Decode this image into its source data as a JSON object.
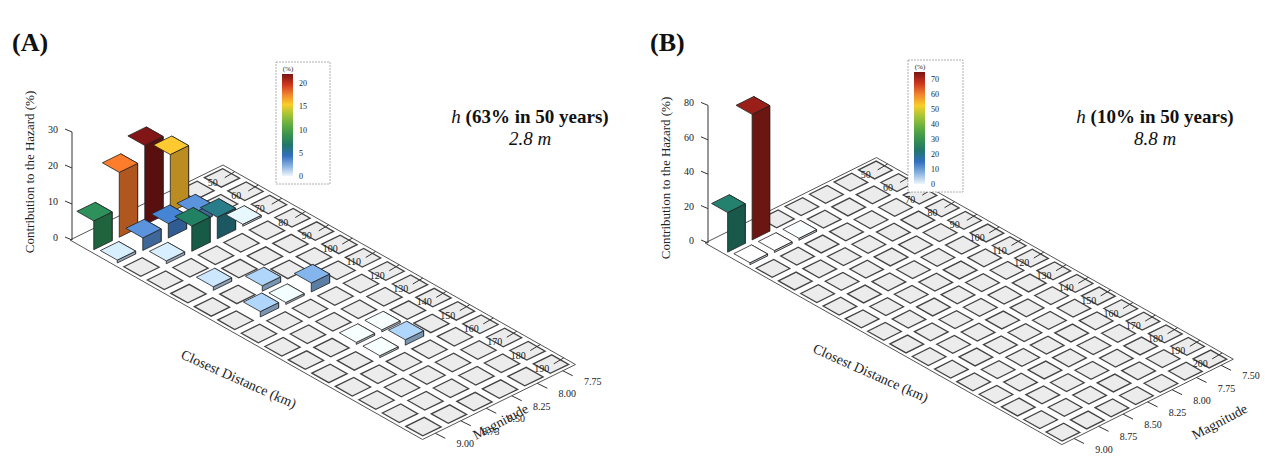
{
  "panels": [
    {
      "id": "A",
      "label": "(A)",
      "hazard_symbol": "h",
      "hazard_prob": "(63% in 50 years)",
      "hazard_value": "2.8 m"
    },
    {
      "id": "B",
      "label": "(B)",
      "hazard_symbol": "h",
      "hazard_prob": "(10% in 50 years)",
      "hazard_value": "8.8 m"
    }
  ],
  "chart_data": [
    {
      "type": "bar3d",
      "title": "(A) h (63% in 50 years) 2.8 m",
      "xlabel": "Closest Distance (km)",
      "ylabel": "Magnitude",
      "zlabel": "Contribution to the Hazard (%)",
      "distance_ticks": [
        50,
        60,
        70,
        80,
        90,
        100,
        110,
        120,
        130,
        140,
        150,
        160,
        170,
        180,
        190
      ],
      "magnitude_ticks": [
        "7.75",
        "8.00",
        "8.25",
        "8.50",
        "8.75",
        "9.00"
      ],
      "z_ticks": [
        0,
        10,
        20,
        30
      ],
      "zlim": [
        0,
        30
      ],
      "colorbar": {
        "unit": "(%)",
        "ticks": [
          0,
          5,
          10,
          15,
          20
        ],
        "range": [
          0,
          22
        ]
      },
      "bars": [
        {
          "distance": 50,
          "magnitude": "9.00",
          "value": 8
        },
        {
          "distance": 50,
          "magnitude": "8.75",
          "value": 18
        },
        {
          "distance": 50,
          "magnitude": "8.50",
          "value": 22
        },
        {
          "distance": 50,
          "magnitude": "8.25",
          "value": 16
        },
        {
          "distance": 60,
          "magnitude": "9.00",
          "value": 0.8
        },
        {
          "distance": 60,
          "magnitude": "8.75",
          "value": 3.5
        },
        {
          "distance": 60,
          "magnitude": "8.50",
          "value": 4
        },
        {
          "distance": 60,
          "magnitude": "8.25",
          "value": 3.5
        },
        {
          "distance": 70,
          "magnitude": "8.75",
          "value": 0.8
        },
        {
          "distance": 70,
          "magnitude": "8.50",
          "value": 7
        },
        {
          "distance": 70,
          "magnitude": "8.25",
          "value": 6
        },
        {
          "distance": 70,
          "magnitude": "8.00",
          "value": 0.5
        },
        {
          "distance": 90,
          "magnitude": "8.75",
          "value": 1
        },
        {
          "distance": 100,
          "magnitude": "8.50",
          "value": 1.5
        },
        {
          "distance": 110,
          "magnitude": "8.75",
          "value": 1.5
        },
        {
          "distance": 110,
          "magnitude": "8.50",
          "value": 0.3
        },
        {
          "distance": 110,
          "magnitude": "8.25",
          "value": 2.5
        },
        {
          "distance": 140,
          "magnitude": "8.50",
          "value": 0.2
        },
        {
          "distance": 140,
          "magnitude": "8.25",
          "value": 0.2
        },
        {
          "distance": 150,
          "magnitude": "8.50",
          "value": 0.2
        },
        {
          "distance": 150,
          "magnitude": "8.25",
          "value": 1.5
        }
      ]
    },
    {
      "type": "bar3d",
      "title": "(B) h (10% in 50 years) 8.8 m",
      "xlabel": "Closest Distance (km)",
      "ylabel": "Magnitude",
      "zlabel": "Contribution to the Hazard (%)",
      "distance_ticks": [
        50,
        60,
        70,
        80,
        90,
        100,
        110,
        120,
        130,
        140,
        150,
        160,
        170,
        180,
        190,
        200
      ],
      "magnitude_ticks": [
        "7.50",
        "7.75",
        "8.00",
        "8.25",
        "8.50",
        "8.75",
        "9.00"
      ],
      "z_ticks": [
        0,
        20,
        40,
        60,
        80
      ],
      "zlim": [
        0,
        80
      ],
      "colorbar": {
        "unit": "(%)",
        "ticks": [
          0,
          10,
          20,
          30,
          40,
          50,
          60,
          70
        ],
        "range": [
          0,
          75
        ]
      },
      "bars": [
        {
          "distance": 50,
          "magnitude": "9.00",
          "value": 23
        },
        {
          "distance": 50,
          "magnitude": "8.75",
          "value": 73
        },
        {
          "distance": 60,
          "magnitude": "9.00",
          "value": 0.3
        },
        {
          "distance": 60,
          "magnitude": "8.75",
          "value": 0.3
        },
        {
          "distance": 60,
          "magnitude": "8.50",
          "value": 0.5
        }
      ]
    }
  ]
}
